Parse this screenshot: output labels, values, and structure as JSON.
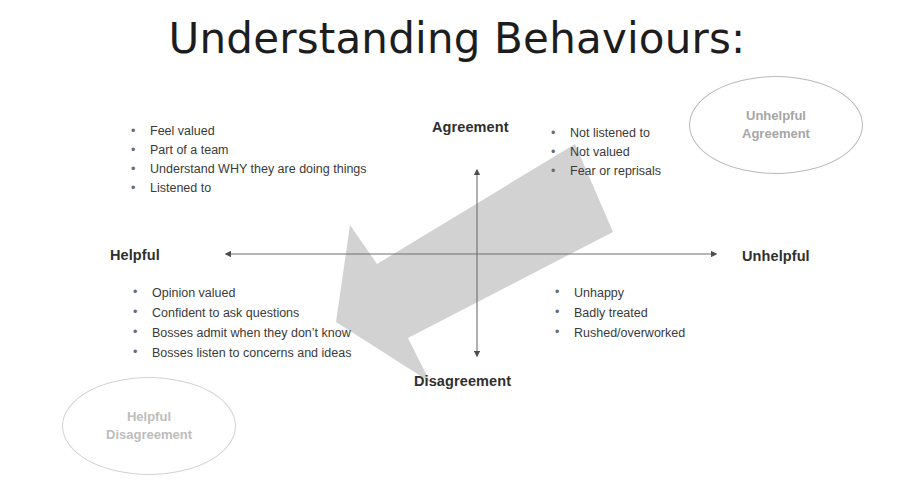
{
  "slide": {
    "title": "Understanding Behaviours:",
    "background_color": "#ffffff"
  },
  "diagram": {
    "type": "2x2-matrix",
    "axes": {
      "vertical": {
        "top_label": "Agreement",
        "bottom_label": "Disagreement",
        "color": "#595959"
      },
      "horizontal": {
        "left_label": "Helpful",
        "right_label": "Unhelpful",
        "color": "#595959"
      }
    },
    "quadrants": {
      "top_left": {
        "name": "Helpful Agreement",
        "bullets": [
          "Feel valued",
          "Part of a team",
          "Understand WHY they are doing things",
          "Listened to"
        ]
      },
      "top_right": {
        "name": "Unhelpful Agreement",
        "bullets": [
          "Not listened to",
          "Not valued",
          "Fear or reprisals"
        ]
      },
      "bottom_left": {
        "name": "Helpful Disagreement",
        "bullets": [
          "Opinion valued",
          "Confident to ask questions",
          "Bosses admit when they don’t know",
          "Bosses listen to concerns and ideas"
        ]
      },
      "bottom_right": {
        "name": "Unhelpful Disagreement",
        "bullets": [
          "Unhappy",
          "Badly treated",
          "Rushed/overworked"
        ]
      }
    },
    "callouts": [
      {
        "id": "unhelpful-agreement",
        "line1": "Unhelpful",
        "line2": "Agreement",
        "shape": "ellipse",
        "text_color": "#a6a6a6",
        "border_color": "#b9b9b9"
      },
      {
        "id": "helpful-disagreement",
        "line1": "Helpful",
        "line2": "Disagreement",
        "shape": "ellipse",
        "text_color": "#bdbdbd",
        "border_color": "#d3d3d3"
      }
    ],
    "arrow": {
      "name": "big-grey-block-arrow",
      "direction": "from top-right (Unhelpful Agreement) to bottom-left (Helpful Disagreement)",
      "fill_color": "#d2d2d2"
    },
    "bullet_glyph": "•"
  }
}
